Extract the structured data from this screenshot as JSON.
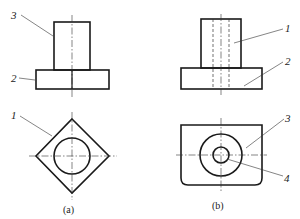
{
  "figure": {
    "a": {
      "caption": "(a)",
      "labels": {
        "front_upper": "3",
        "front_base": "2",
        "top_diamond": "1"
      }
    },
    "b": {
      "caption": "(b)",
      "labels": {
        "front_upper": "1",
        "front_base": "2",
        "top_plate": "3",
        "top_hole": "4"
      }
    }
  },
  "colors": {
    "line": "#1a1a1a",
    "background": "#ffffff"
  }
}
